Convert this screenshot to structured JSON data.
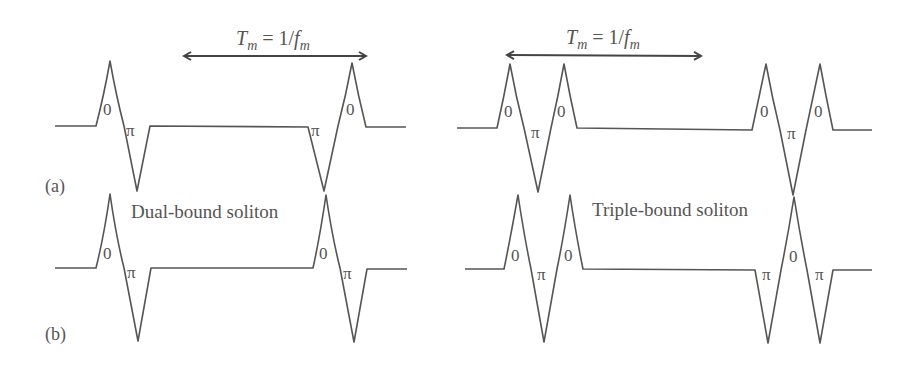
{
  "figure": {
    "panels": [
      {
        "id": "a",
        "label": "(a)"
      },
      {
        "id": "b",
        "label": "(b)"
      }
    ],
    "period_label": {
      "T": "T",
      "m": "m",
      "eq": " = 1/",
      "f": "f",
      "fm": "m"
    },
    "left_title": "Dual-bound soliton",
    "right_title": "Triple-bound soliton",
    "phase_zero": "0",
    "phase_pi": "π"
  }
}
